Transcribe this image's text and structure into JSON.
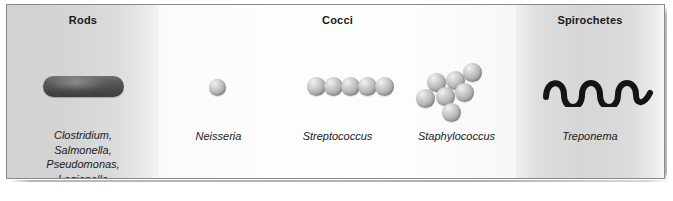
{
  "figure": {
    "frame_border_color": "#8a8a8a",
    "background_color": "#fcfcfc"
  },
  "panels": [
    {
      "id": "rods",
      "title": "Rods",
      "organisms": "Clostridium,\nSalmonella,\nPseudomonas,\nLegionella",
      "shape": "rod",
      "shape_color": "#4a4a4a",
      "background": "gray-gradient"
    },
    {
      "id": "cocci",
      "title": "Cocci",
      "background": "white",
      "groups": [
        {
          "id": "neisseria",
          "organisms": "Neisseria",
          "shape": "single-coccus",
          "count": 1
        },
        {
          "id": "streptococcus",
          "organisms": "Streptococcus",
          "shape": "chain-of-cocci",
          "count": 5
        },
        {
          "id": "staphylococcus",
          "organisms": "Staphylococcus",
          "shape": "cluster-of-cocci",
          "count": 7
        }
      ]
    },
    {
      "id": "spirochetes",
      "title": "Spirochetes",
      "organisms": "Treponema",
      "shape": "helical-wave",
      "shape_color": "#1a1a1a",
      "wave_cycles": 3,
      "background": "gray-gradient"
    }
  ],
  "colors": {
    "text": "#1a1a1a",
    "coccus_light": "#f2f2f2",
    "coccus_mid": "#bdbdbd",
    "coccus_dark": "#8a8a8a",
    "panel_gray": "#d6d6d6",
    "panel_white": "#fdfdfd"
  }
}
